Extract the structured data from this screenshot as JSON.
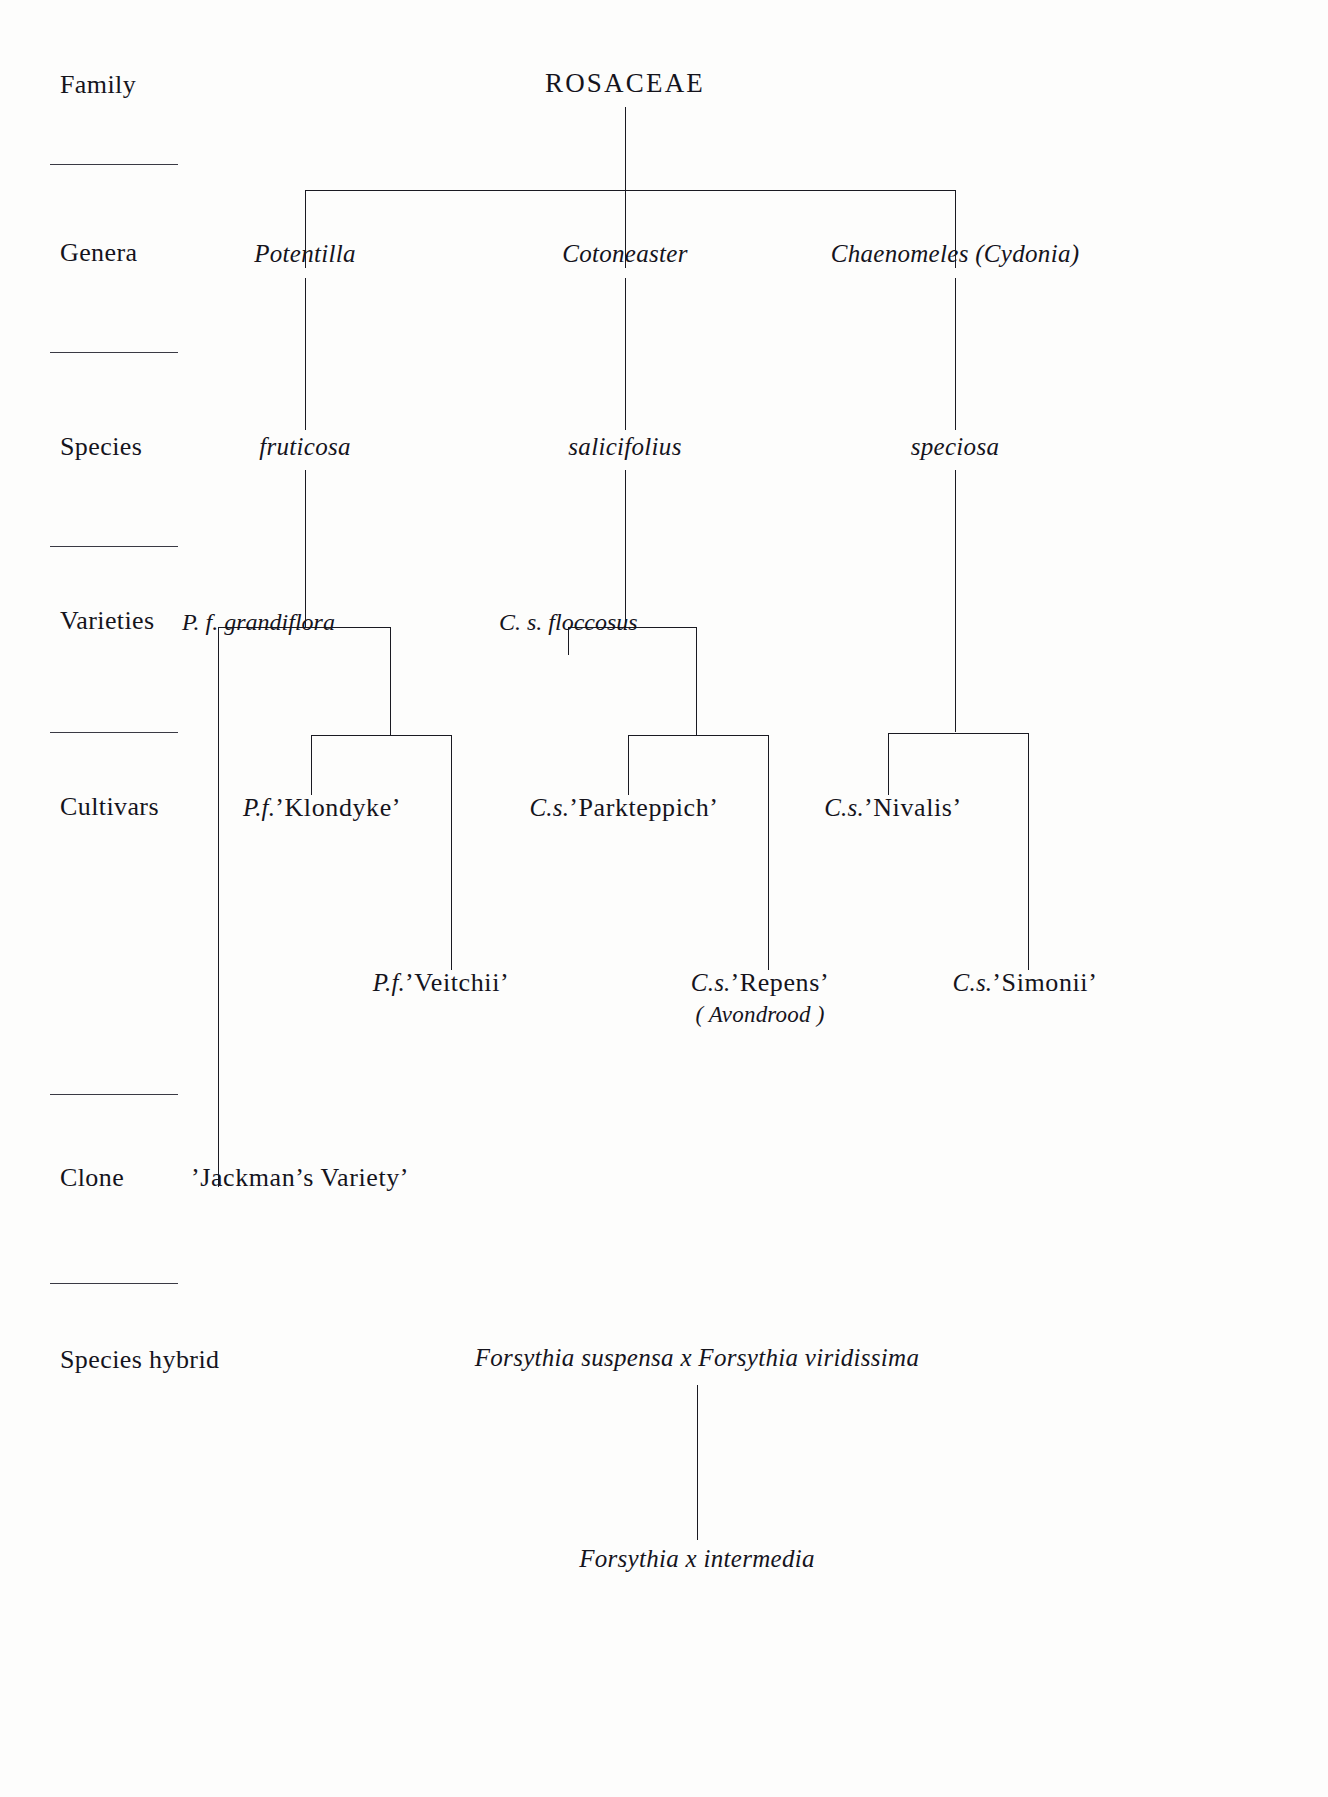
{
  "diagram": {
    "type": "taxonomic-hierarchy-tree",
    "family_title": "ROSACEAE"
  },
  "ranks": [
    {
      "key": "family",
      "label": "Family"
    },
    {
      "key": "genera",
      "label": "Genera"
    },
    {
      "key": "species",
      "label": "Species"
    },
    {
      "key": "varieties",
      "label": "Varieties"
    },
    {
      "key": "cultivars",
      "label": "Cultivars"
    },
    {
      "key": "clone",
      "label": "Clone"
    },
    {
      "key": "species_hybrid",
      "label": "Species hybrid"
    }
  ],
  "genera": [
    {
      "name": "Potentilla"
    },
    {
      "name": "Cotoneaster"
    },
    {
      "name": "Chaenomeles (Cydonia)"
    }
  ],
  "species": [
    {
      "name": "fruticosa"
    },
    {
      "name": "salicifolius"
    },
    {
      "name": "speciosa"
    }
  ],
  "varieties": [
    {
      "abbr": "P. f. ",
      "name": "grandiflora"
    },
    {
      "abbr": "C. s. ",
      "name": "floccosus"
    }
  ],
  "cultivars": [
    {
      "abbr": "P.f.",
      "name": "’Klondyke’"
    },
    {
      "abbr": "C.s.",
      "name": "’Parkteppich’"
    },
    {
      "abbr": "C.s.",
      "name": "’Nivalis’"
    },
    {
      "abbr": "P.f.",
      "name": "’Veitchii’"
    },
    {
      "abbr": "C.s.",
      "name": "’Repens’",
      "synonym": "( Avondrood )"
    },
    {
      "abbr": "C.s.",
      "name": "’Simonii’"
    }
  ],
  "clone": {
    "name": "’Jackman’s  Variety’"
  },
  "species_hybrid": {
    "parents": "Forsythia suspensa x Forsythia viridissima",
    "offspring": "Forsythia x intermedia"
  }
}
